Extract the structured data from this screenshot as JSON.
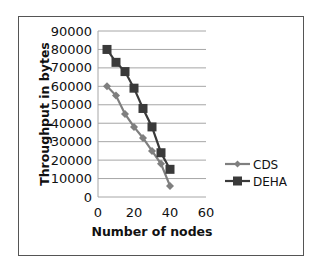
{
  "chart_data": {
    "type": "line",
    "title": "",
    "xlabel": "Number of nodes",
    "ylabel": "Throughput in bytes",
    "xlim": [
      0,
      60
    ],
    "ylim": [
      0,
      90000
    ],
    "x_ticks": [
      "0",
      "20",
      "40",
      "60"
    ],
    "y_ticks": [
      "0",
      "10000",
      "20000",
      "30000",
      "40000",
      "50000",
      "60000",
      "70000",
      "80000",
      "90000"
    ],
    "grid": "horizontal",
    "legend_position": "right",
    "x": [
      5,
      10,
      15,
      20,
      25,
      30,
      35,
      40
    ],
    "series": [
      {
        "name": "CDS",
        "marker": "diamond",
        "color": "#7f7f7f",
        "values": [
          60000,
          55000,
          45000,
          38000,
          32000,
          25000,
          18000,
          6000
        ]
      },
      {
        "name": "DEHA",
        "marker": "square",
        "color": "#3a3a3a",
        "values": [
          80000,
          73000,
          68000,
          59000,
          48000,
          38000,
          24000,
          15000
        ]
      }
    ]
  }
}
